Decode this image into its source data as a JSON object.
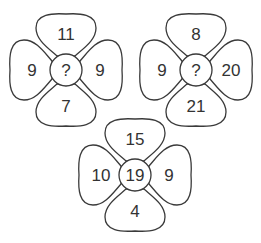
{
  "puzzle": {
    "flowers": [
      {
        "id": "flower-1",
        "top": "11",
        "left": "9",
        "right": "9",
        "bottom": "7",
        "center": "?"
      },
      {
        "id": "flower-2",
        "top": "8",
        "left": "9",
        "right": "20",
        "bottom": "21",
        "center": "?"
      },
      {
        "id": "flower-3",
        "top": "15",
        "left": "10",
        "right": "9",
        "bottom": "4",
        "center": "19"
      }
    ],
    "colors": {
      "stroke": "#3a3a3a",
      "text": "#333333",
      "background": "#ffffff"
    }
  }
}
